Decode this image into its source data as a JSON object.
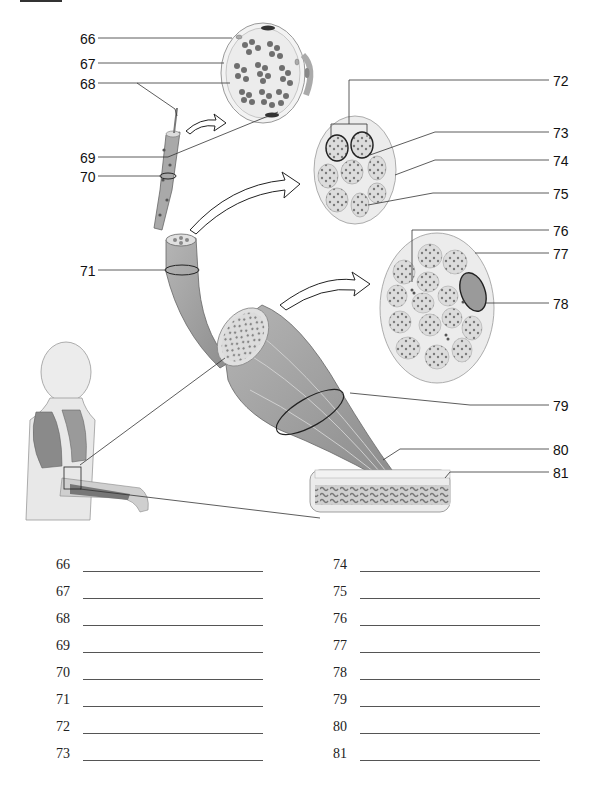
{
  "diagram": {
    "callout_labels": [
      {
        "num": "66",
        "x": 80,
        "y": 33
      },
      {
        "num": "67",
        "x": 80,
        "y": 58
      },
      {
        "num": "68",
        "x": 80,
        "y": 77
      },
      {
        "num": "69",
        "x": 80,
        "y": 150
      },
      {
        "num": "70",
        "x": 80,
        "y": 170
      },
      {
        "num": "71",
        "x": 80,
        "y": 264
      },
      {
        "num": "72",
        "x": 557,
        "y": 74
      },
      {
        "num": "73",
        "x": 557,
        "y": 126
      },
      {
        "num": "74",
        "x": 557,
        "y": 153
      },
      {
        "num": "75",
        "x": 557,
        "y": 186
      },
      {
        "num": "76",
        "x": 557,
        "y": 224
      },
      {
        "num": "77",
        "x": 557,
        "y": 247
      },
      {
        "num": "78",
        "x": 557,
        "y": 298
      },
      {
        "num": "79",
        "x": 557,
        "y": 400
      },
      {
        "num": "80",
        "x": 557,
        "y": 442
      },
      {
        "num": "81",
        "x": 557,
        "y": 466
      }
    ]
  },
  "answers": {
    "left": [
      {
        "num": "66",
        "value": ""
      },
      {
        "num": "67",
        "value": ""
      },
      {
        "num": "68",
        "value": ""
      },
      {
        "num": "69",
        "value": ""
      },
      {
        "num": "70",
        "value": ""
      },
      {
        "num": "71",
        "value": ""
      },
      {
        "num": "72",
        "value": ""
      },
      {
        "num": "73",
        "value": ""
      }
    ],
    "right": [
      {
        "num": "74",
        "value": ""
      },
      {
        "num": "75",
        "value": ""
      },
      {
        "num": "76",
        "value": ""
      },
      {
        "num": "77",
        "value": ""
      },
      {
        "num": "78",
        "value": ""
      },
      {
        "num": "79",
        "value": ""
      },
      {
        "num": "80",
        "value": ""
      },
      {
        "num": "81",
        "value": ""
      }
    ]
  },
  "colors": {
    "ink": "#111111",
    "muscle_gray": "#9a9a9a",
    "tissue_light": "#e4e4e4",
    "fiber_dark": "#6e6e6e"
  }
}
